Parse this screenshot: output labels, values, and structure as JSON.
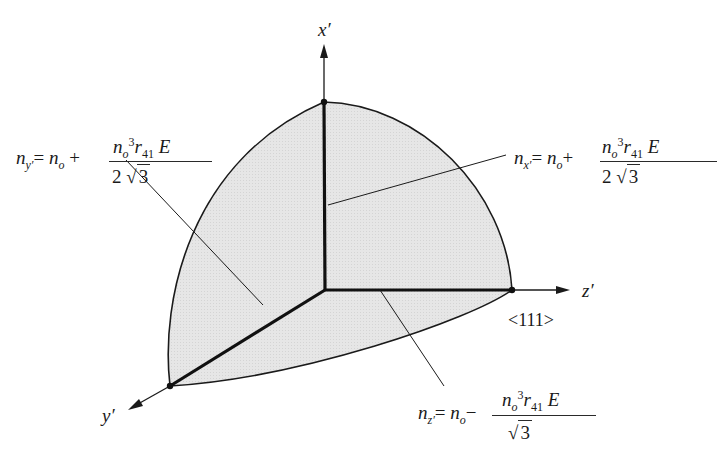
{
  "axes": {
    "x": {
      "label": "x′"
    },
    "y": {
      "label": "y′"
    },
    "z": {
      "label": "z′",
      "direction_label": "<111>"
    }
  },
  "equations": {
    "nx": {
      "lhs_var": "n",
      "lhs_sub": "x′",
      "eq": "=",
      "base": "n",
      "base_sub": "o",
      "op": "+",
      "num_n": "n",
      "num_n_sub": "o",
      "num_pow": "3",
      "num_r": "r",
      "num_r_sub": "41",
      "num_E": "E",
      "den_coef": "2",
      "den_root": "3"
    },
    "ny": {
      "lhs_var": "n",
      "lhs_sub": "y′",
      "eq": "=",
      "base": "n",
      "base_sub": "o",
      "op": "+",
      "num_n": "n",
      "num_n_sub": "o",
      "num_pow": "3",
      "num_r": "r",
      "num_r_sub": "41",
      "num_E": "E",
      "den_coef": "2",
      "den_root": "3"
    },
    "nz": {
      "lhs_var": "n",
      "lhs_sub": "z′",
      "eq": "=",
      "base": "n",
      "base_sub": "o",
      "op": "−",
      "num_n": "n",
      "num_n_sub": "o",
      "num_pow": "3",
      "num_r": "r",
      "num_r_sub": "41",
      "num_E": "E",
      "den_coef": "",
      "den_root": "3"
    }
  },
  "colors": {
    "fill": "#e4e4e4",
    "stroke": "#1a1a1a"
  }
}
